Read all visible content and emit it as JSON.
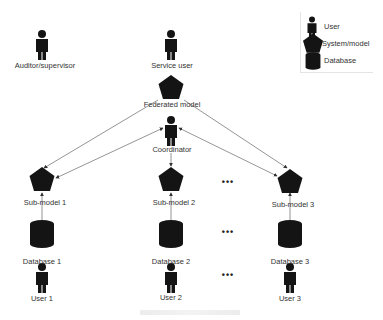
{
  "diagram": {
    "type": "federated-learning-architecture",
    "colors": {
      "shape_fill": "#141414",
      "edge": "#7a7a7a",
      "text": "#333333"
    },
    "legend": [
      {
        "icon": "user-icon",
        "label": "User"
      },
      {
        "icon": "pentagon-icon",
        "label": "System/model"
      },
      {
        "icon": "database-icon",
        "label": "Database"
      }
    ],
    "nodes": {
      "auditor": {
        "label": "Auditor/supervisor",
        "kind": "user"
      },
      "service_user": {
        "label": "Service user",
        "kind": "user"
      },
      "federated_model": {
        "label": "Federated model",
        "kind": "system"
      },
      "coordinator": {
        "label": "Coordinator",
        "kind": "user"
      },
      "submodels": [
        {
          "label": "Sub-model  1",
          "kind": "system"
        },
        {
          "label": "Sub-model  2",
          "kind": "system"
        },
        {
          "label": "Sub-model  3",
          "kind": "system"
        }
      ],
      "databases": [
        {
          "label": "Database 1",
          "kind": "database"
        },
        {
          "label": "Database 2",
          "kind": "database"
        },
        {
          "label": "Database 3",
          "kind": "database"
        }
      ],
      "users": [
        {
          "label": "User 1",
          "kind": "user"
        },
        {
          "label": "User 2",
          "kind": "user"
        },
        {
          "label": "User 3",
          "kind": "user"
        }
      ]
    },
    "ellipsis": "•••",
    "edges": [
      {
        "from": "federated_model",
        "to": "submodels.0"
      },
      {
        "from": "federated_model",
        "to": "submodels.2"
      },
      {
        "from": "coordinator",
        "to": "submodels.0",
        "bidirectional": true
      },
      {
        "from": "coordinator",
        "to": "submodels.1"
      },
      {
        "from": "coordinator",
        "to": "submodels.2",
        "bidirectional": true
      },
      {
        "from": "databases.0",
        "to": "submodels.0"
      },
      {
        "from": "databases.1",
        "to": "submodels.1"
      },
      {
        "from": "databases.2",
        "to": "submodels.2"
      }
    ],
    "caption": ""
  }
}
